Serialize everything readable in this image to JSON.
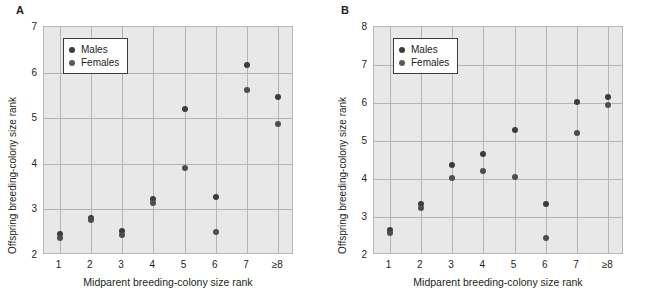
{
  "figure": {
    "background": "#ffffff",
    "marker_male_color": "#3c3c3c",
    "marker_female_color": "#4d4d4d",
    "plot_background": "#e8e8e8",
    "grid_color": "#b4b4b4"
  },
  "chart_data": [
    {
      "type": "scatter",
      "panel_label": "A",
      "title": "",
      "xlabel": "Midparent breeding-colony size rank",
      "ylabel": "Offspring breeding-colony size rank",
      "categories": [
        "1",
        "2",
        "3",
        "4",
        "5",
        "6",
        "7",
        "≥8"
      ],
      "x": [
        1,
        2,
        3,
        4,
        5,
        6,
        7,
        8
      ],
      "xlim": [
        0.5,
        8.5
      ],
      "ylim": [
        2,
        7
      ],
      "yticks": [
        2,
        3,
        4,
        5,
        6,
        7
      ],
      "xticks": [
        "1",
        "2",
        "3",
        "4",
        "5",
        "6",
        "7",
        "≥8"
      ],
      "grid": true,
      "legend": [
        "Males",
        "Females"
      ],
      "legend_position": "top-left",
      "series": [
        {
          "name": "Males",
          "values": [
            2.45,
            2.82,
            2.52,
            3.22,
            5.21,
            3.28,
            6.16,
            5.46
          ]
        },
        {
          "name": "Females",
          "values": [
            2.37,
            2.77,
            2.43,
            3.15,
            3.91,
            2.51,
            5.61,
            4.88
          ]
        }
      ]
    },
    {
      "type": "scatter",
      "panel_label": "B",
      "title": "",
      "xlabel": "Midparent breeding-colony size rank",
      "ylabel": "Offspring breeding-colony size rank",
      "categories": [
        "1",
        "2",
        "3",
        "4",
        "5",
        "6",
        "7",
        "≥8"
      ],
      "x": [
        1,
        2,
        3,
        4,
        5,
        6,
        7,
        8
      ],
      "xlim": [
        0.5,
        8.5
      ],
      "ylim": [
        2,
        8
      ],
      "yticks": [
        2,
        3,
        4,
        5,
        6,
        7,
        8
      ],
      "xticks": [
        "1",
        "2",
        "3",
        "4",
        "5",
        "6",
        "7",
        "≥8"
      ],
      "grid": true,
      "legend": [
        "Males",
        "Females"
      ],
      "legend_position": "top-left",
      "series": [
        {
          "name": "Males",
          "values": [
            2.66,
            3.35,
            4.37,
            4.65,
            5.29,
            3.33,
            6.02,
            6.17
          ]
        },
        {
          "name": "Females",
          "values": [
            2.57,
            3.23,
            4.03,
            4.21,
            4.06,
            2.44,
            5.21,
            5.94
          ]
        }
      ]
    }
  ]
}
